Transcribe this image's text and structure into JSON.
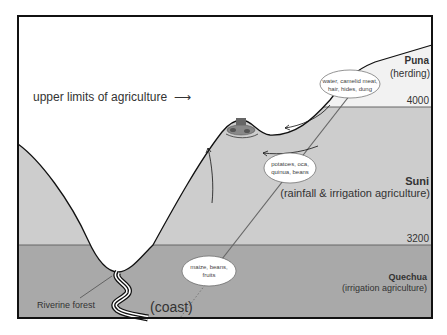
{
  "labels": {
    "upper_limits": "upper limits of agriculture",
    "upper_limits_arrow": "⟶",
    "riverine_forest": "Riverine forest",
    "coast": "(coast)"
  },
  "zones": [
    {
      "name": "Puna",
      "use": "(herding)",
      "altitude": "4000"
    },
    {
      "name": "Suni",
      "use": "(rainfall & irrigation agriculture)",
      "altitude": "3200"
    },
    {
      "name": "Quechua",
      "use": "(irrigation agriculture)"
    }
  ],
  "resources": [
    {
      "line1": "water, camelid meat,",
      "line2": "hair, hides, dung"
    },
    {
      "line1": "potatoes, oca,",
      "line2": "quinua, beans"
    },
    {
      "line1": "maize, beans,",
      "line2": "fruits"
    }
  ],
  "colors": {
    "puna": "#f2f2f2",
    "suni": "#cdcdcd",
    "quechua": "#a9a9a9",
    "outline": "#111111"
  }
}
